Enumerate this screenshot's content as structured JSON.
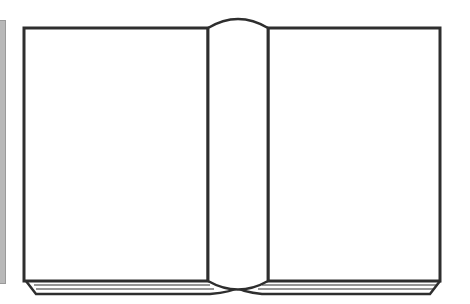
{
  "illustration": {
    "subject": "open book",
    "colors": {
      "outline": "#2e2e2e",
      "page_fill": "#ffffff",
      "side_bar": "#b8b8b8",
      "background": "#ffffff"
    }
  }
}
